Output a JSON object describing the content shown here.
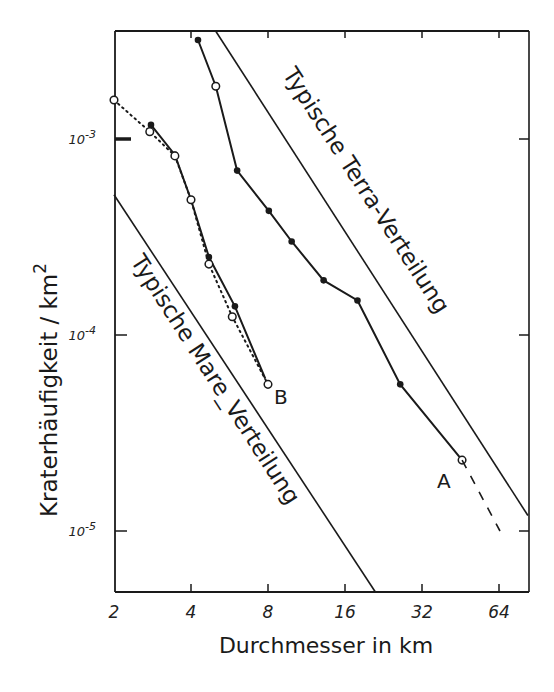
{
  "chart_data": {
    "type": "line",
    "title": "",
    "xlabel": "Durchmesser in km",
    "ylabel": "Kraterhäufigkeit / km²",
    "ylabel_text": "Kraterhäufigkeit / km",
    "ylabel_sup": "2",
    "xscale": "log2",
    "yscale": "log10",
    "xlim": [
      2,
      80
    ],
    "ylim": [
      3.3e-06,
      0.00355
    ],
    "x_ticks": [
      2,
      4,
      8,
      16,
      32,
      64
    ],
    "x_tick_labels": [
      "2",
      "4",
      "8",
      "16",
      "32",
      "64"
    ],
    "y_ticks": [
      0.001,
      0.0001,
      1e-05
    ],
    "y_tick_labels": [
      {
        "base": "10",
        "exp": "-3"
      },
      {
        "base": "10",
        "exp": "-4"
      },
      {
        "base": "10",
        "exp": "-5"
      }
    ],
    "grid": false,
    "annotations": [
      {
        "text": "Typische Terra-Verteilung",
        "kind": "rotated-label"
      },
      {
        "text": "Typische Mare_Verteilung",
        "kind": "rotated-label"
      },
      {
        "text": "A",
        "kind": "curve-label"
      },
      {
        "text": "B",
        "kind": "curve-label"
      }
    ],
    "series": [
      {
        "name": "A",
        "style": "solid",
        "x": [
          4.26,
          5.0,
          6.06,
          8.06,
          9.9,
          13.2,
          17.9,
          26.3,
          45.9
        ],
        "y": [
          0.0032,
          0.00186,
          0.00069,
          0.00043,
          0.0003,
          0.00019,
          0.00015,
          5.6e-05,
          2.3e-05
        ],
        "markers": [
          "filled",
          "open",
          "filled",
          "filled",
          "filled",
          "filled",
          "filled",
          "filled",
          "open"
        ]
      },
      {
        "name": "A (extrapolated)",
        "style": "dashed",
        "x": [
          45.9,
          64.6
        ],
        "y": [
          2.3e-05,
          1e-05
        ]
      },
      {
        "name": "B (solid)",
        "style": "solid",
        "x": [
          2.79,
          3.46,
          4.0,
          4.7,
          5.94,
          7.8
        ],
        "y": [
          0.00118,
          0.00083,
          0.00049,
          0.00025,
          0.00014,
          6e-05
        ],
        "markers": [
          "filled",
          "filled",
          "filled",
          "filled",
          "filled",
          "none"
        ]
      },
      {
        "name": "B (dotted)",
        "style": "dotted",
        "x": [
          2.0,
          2.76,
          3.46,
          4.0,
          4.7,
          5.8,
          8.0
        ],
        "y": [
          0.00158,
          0.00109,
          0.00082,
          0.00049,
          0.00023,
          0.000124,
          5.6e-05
        ],
        "markers": [
          "open",
          "open",
          "open",
          "open",
          "open",
          "open",
          "open"
        ]
      },
      {
        "name": "Typische Terra-Verteilung",
        "style": "solid-thin",
        "x": [
          5.0,
          83
        ],
        "y": [
          0.00355,
          1.2e-05
        ]
      },
      {
        "name": "Typische Mare-Verteilung",
        "style": "solid-thin",
        "x": [
          2.0,
          21
        ],
        "y": [
          0.00052,
          4.9e-06
        ]
      }
    ]
  },
  "labels": {
    "terra": "Typische Terra-Verteilung",
    "mare": "Typische Mare_Verteilung",
    "curve_a": "A",
    "curve_b": "B"
  },
  "colors": {
    "ink": "#1a1a1a",
    "paper": "#ffffff"
  }
}
